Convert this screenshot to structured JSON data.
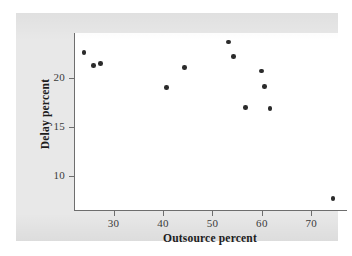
{
  "chart_data": {
    "type": "scatter",
    "title": "",
    "xlabel": "Outsource percent",
    "ylabel": "Delay percent",
    "xlim": [
      22,
      77
    ],
    "ylim": [
      6.5,
      24.6
    ],
    "xticks": [
      30,
      40,
      50,
      60,
      70
    ],
    "yticks": [
      10,
      15,
      20
    ],
    "grid": false,
    "legend": null,
    "marker": "filled-circle",
    "marker_color": "#2b2b2b",
    "series": [
      {
        "name": "airlines",
        "points": [
          {
            "x": 24.0,
            "y": 22.6
          },
          {
            "x": 25.9,
            "y": 21.3
          },
          {
            "x": 27.4,
            "y": 21.5
          },
          {
            "x": 40.7,
            "y": 19.0
          },
          {
            "x": 44.4,
            "y": 21.1
          },
          {
            "x": 53.2,
            "y": 23.7
          },
          {
            "x": 54.2,
            "y": 22.2
          },
          {
            "x": 56.7,
            "y": 17.0
          },
          {
            "x": 59.9,
            "y": 20.7
          },
          {
            "x": 60.5,
            "y": 19.1
          },
          {
            "x": 61.6,
            "y": 16.9
          },
          {
            "x": 74.4,
            "y": 7.7
          }
        ]
      }
    ]
  },
  "figure": {
    "panel_color": "#e8e8e8",
    "plot_background": "#ffffff",
    "axis_color": "#6e6e6e",
    "text_color": "#1d1d1d"
  }
}
